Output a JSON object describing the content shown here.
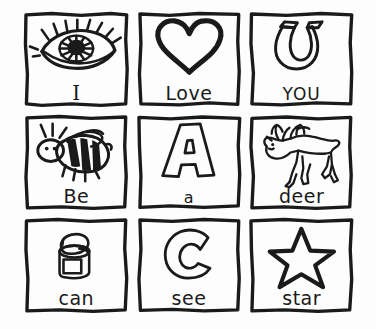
{
  "page": {
    "background_color": "#fdfdfd",
    "ink_color": "#1a1a1a",
    "rows": 3,
    "columns": 3
  },
  "cells": [
    {
      "label": "I",
      "picture": "eye-drawing",
      "picture_name": "eye",
      "row": 1,
      "column": 1
    },
    {
      "label": "Love",
      "picture": "heart-drawing",
      "picture_name": "heart",
      "row": 1,
      "column": 2
    },
    {
      "label": "YOU",
      "picture": "magnet-drawing",
      "picture_name": "magnet",
      "row": 1,
      "column": 3
    },
    {
      "label": "Be",
      "picture": "bee-drawing",
      "picture_name": "bee",
      "row": 2,
      "column": 1
    },
    {
      "label": "a",
      "picture": "letter-a-drawing",
      "picture_name": "letter A",
      "row": 2,
      "column": 2
    },
    {
      "label": "deer",
      "picture": "deer-drawing",
      "picture_name": "deer",
      "row": 2,
      "column": 3
    },
    {
      "label": "can",
      "picture": "can-drawing",
      "picture_name": "tin can",
      "row": 3,
      "column": 1
    },
    {
      "label": "see",
      "picture": "letter-c-drawing",
      "picture_name": "letter C",
      "row": 3,
      "column": 2
    },
    {
      "label": "star",
      "picture": "star-drawing",
      "picture_name": "star",
      "row": 3,
      "column": 3
    }
  ]
}
